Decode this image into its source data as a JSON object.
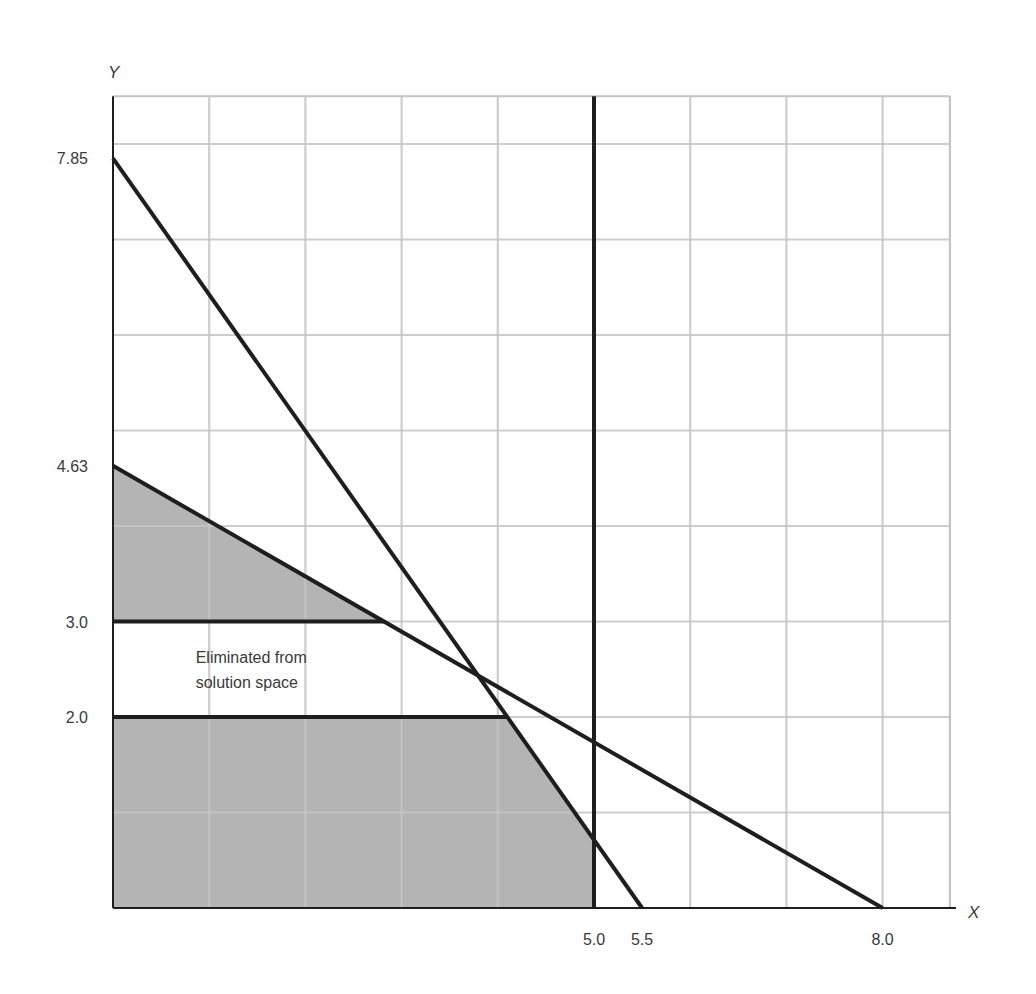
{
  "chart_data": {
    "type": "line",
    "title": "",
    "xlabel": "X",
    "ylabel": "Y",
    "xlim": [
      0,
      8.7
    ],
    "ylim": [
      0,
      8.5
    ],
    "grid": true,
    "grid_step": 1,
    "x_tick_labels": [
      {
        "value": 5.0,
        "label": "5.0"
      },
      {
        "value": 5.5,
        "label": "5.5"
      },
      {
        "value": 8.0,
        "label": "8.0"
      }
    ],
    "y_tick_labels": [
      {
        "value": 7.85,
        "label": "7.85"
      },
      {
        "value": 4.63,
        "label": "4.63"
      },
      {
        "value": 3.0,
        "label": "3.0"
      },
      {
        "value": 2.0,
        "label": "2.0"
      }
    ],
    "series": [
      {
        "name": "constraint-steep",
        "points": [
          [
            0,
            7.85
          ],
          [
            5.5,
            0
          ]
        ]
      },
      {
        "name": "constraint-shallow",
        "points": [
          [
            0,
            4.63
          ],
          [
            8.0,
            0
          ]
        ]
      },
      {
        "name": "constraint-x-le-5",
        "points": [
          [
            5.0,
            0
          ],
          [
            5.0,
            8.5
          ]
        ]
      },
      {
        "name": "branch-y-le-2",
        "points": [
          [
            0,
            2.0
          ],
          [
            4.1,
            2.0
          ]
        ]
      },
      {
        "name": "branch-y-ge-3",
        "points": [
          [
            0,
            3.0
          ],
          [
            2.82,
            3.0
          ]
        ]
      }
    ],
    "shaded_regions": [
      {
        "name": "subproblem-y-ge-3",
        "polygon": [
          [
            0,
            3.0
          ],
          [
            2.82,
            3.0
          ],
          [
            0,
            4.63
          ]
        ]
      },
      {
        "name": "subproblem-y-le-2",
        "polygon": [
          [
            0,
            0
          ],
          [
            5.0,
            0
          ],
          [
            5.0,
            0.714
          ],
          [
            4.1,
            2.0
          ],
          [
            0,
            2.0
          ]
        ]
      }
    ],
    "annotations": [
      {
        "text_lines": [
          "Eliminated from",
          "solution space"
        ],
        "x": 0.87,
        "y": 2.6
      }
    ]
  },
  "colors": {
    "background": "#ffffff",
    "shade": "#b4b4b4",
    "grid": "#c4c4c4",
    "grid_on_shade": "#9a9a9a",
    "line": "#1e1e1e",
    "text": "#3a3a3a"
  }
}
